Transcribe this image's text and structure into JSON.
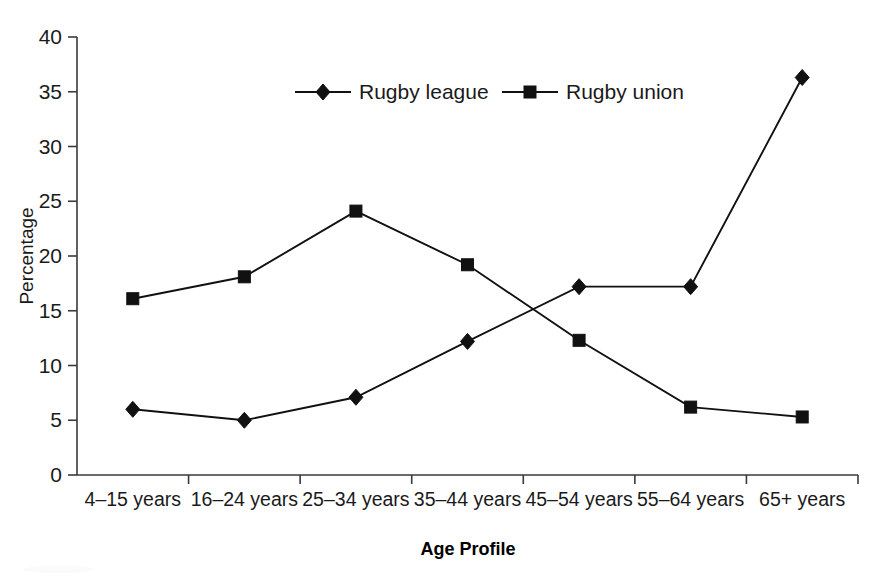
{
  "chart_data": {
    "type": "line",
    "title": "",
    "xlabel": "Age Profile",
    "ylabel": "Percentage",
    "categories": [
      "4–15 years",
      "16–24 years",
      "25–34 years",
      "35–44 years",
      "45–54 years",
      "55–64 years",
      "65+ years"
    ],
    "series": [
      {
        "name": "Rugby league",
        "marker": "diamond",
        "color": "#111111",
        "values": [
          6.0,
          5.0,
          7.1,
          12.2,
          17.2,
          17.2,
          36.3
        ]
      },
      {
        "name": "Rugby union",
        "marker": "square",
        "color": "#111111",
        "values": [
          16.1,
          18.1,
          24.1,
          19.2,
          12.3,
          6.2,
          5.3
        ]
      }
    ],
    "ylim": [
      0,
      40
    ],
    "yticks": [
      0,
      5,
      10,
      15,
      20,
      25,
      30,
      35,
      40
    ],
    "ytick_labels": [
      "0",
      "5",
      "10",
      "15",
      "20",
      "25",
      "30",
      "35",
      "40"
    ],
    "grid": false,
    "legend_position": "top-center"
  },
  "legend": {
    "entries": [
      {
        "label": "Rugby league",
        "marker": "diamond-icon"
      },
      {
        "label": "Rugby union",
        "marker": "square-icon"
      }
    ]
  },
  "axes": {
    "y_title": "Percentage",
    "x_title": "Age Profile"
  }
}
